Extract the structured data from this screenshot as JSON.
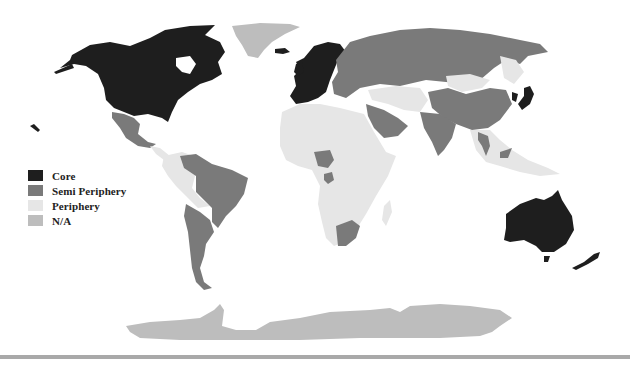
{
  "map": {
    "type": "world-systems-choropleth",
    "colors": {
      "core": "#1e1e1e",
      "semi_periphery": "#7a7a7a",
      "periphery": "#e6e6e6",
      "na": "#bdbdbd",
      "background": "#ffffff",
      "rule": "#a9a9a9"
    },
    "regions": {
      "north_america": "core",
      "greenland": "na",
      "iceland": "core",
      "mexico": "semi_periphery",
      "central_america": "periphery",
      "brazil": "semi_periphery",
      "argentina_chile": "semi_periphery",
      "andean_south_america": "periphery",
      "western_europe": "core",
      "scandinavia": "core",
      "russia_eastern_europe": "semi_periphery",
      "central_asia": "periphery",
      "mongolia": "periphery",
      "china": "semi_periphery",
      "india": "semi_periphery",
      "saudi_arabia": "semi_periphery",
      "japan": "core",
      "korea": "core",
      "southeast_asia": "periphery",
      "thailand_malaysia": "semi_periphery",
      "africa": "periphery",
      "nigeria": "semi_periphery",
      "gabon": "semi_periphery",
      "south_africa": "semi_periphery",
      "australia": "core",
      "new_zealand": "core",
      "antarctica": "na"
    }
  },
  "legend": {
    "items": [
      {
        "label": "Core",
        "color": "#1e1e1e"
      },
      {
        "label": "Semi Periphery",
        "color": "#7a7a7a"
      },
      {
        "label": "Periphery",
        "color": "#e6e6e6"
      },
      {
        "label": "N/A",
        "color": "#bdbdbd"
      }
    ]
  }
}
